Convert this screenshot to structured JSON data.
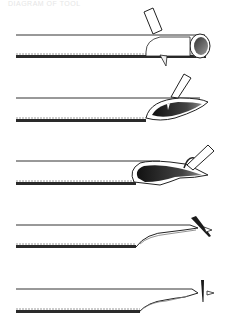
{
  "caption": "DIAGRAM OF TOOL",
  "figure": {
    "panels": [
      {
        "step": 1,
        "description": "round tube with cylindrical open end, blade inserted at angle on top"
      },
      {
        "step": 2,
        "description": "tube cut obliquely forming elongated oval opening, blade on top"
      },
      {
        "step": 3,
        "description": "oval opening enlarged with dark interior, curled strip lifted by blade"
      },
      {
        "step": 4,
        "description": "tube flattened and tapered, dark blade and small triangle near tip"
      },
      {
        "step": 5,
        "description": "tube flattened to tip, vertical blade and small triangle at end"
      }
    ],
    "colors": {
      "line": "#1a1a1a",
      "dark_fill": "#2b2b2b",
      "mid_fill": "#7a7a7a",
      "light_fill": "#f4f4f4"
    }
  }
}
